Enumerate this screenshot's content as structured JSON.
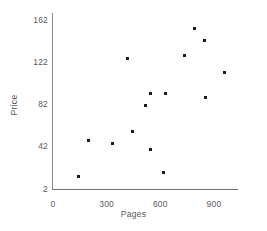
{
  "chart_data": {
    "type": "scatter",
    "title": "",
    "xlabel": "Pages",
    "ylabel": "Price",
    "xlim": [
      0,
      1000
    ],
    "ylim": [
      2,
      172
    ],
    "xticks": [
      0,
      300,
      600,
      900
    ],
    "xtick_labels": [
      "0",
      "300",
      "600",
      "900"
    ],
    "yticks": [
      2,
      42,
      82,
      122,
      162
    ],
    "ytick_labels": [
      "2",
      "42",
      "82",
      "122",
      "162"
    ],
    "grid": false,
    "legend": false,
    "marker": "square",
    "marker_color": "#1c1c1c",
    "axis_color": "#6f6f6f",
    "background": "#ffffff",
    "n_points": 15,
    "points": [
      {
        "pages": 145,
        "price": 14
      },
      {
        "pages": 200,
        "price": 48
      },
      {
        "pages": 330,
        "price": 45
      },
      {
        "pages": 418,
        "price": 126
      },
      {
        "pages": 445,
        "price": 56
      },
      {
        "pages": 518,
        "price": 81
      },
      {
        "pages": 546,
        "price": 92
      },
      {
        "pages": 546,
        "price": 39
      },
      {
        "pages": 618,
        "price": 18
      },
      {
        "pages": 630,
        "price": 92
      },
      {
        "pages": 735,
        "price": 128
      },
      {
        "pages": 790,
        "price": 154
      },
      {
        "pages": 847,
        "price": 143
      },
      {
        "pages": 852,
        "price": 89
      },
      {
        "pages": 958,
        "price": 112
      }
    ],
    "x": [
      145,
      200,
      330,
      418,
      445,
      518,
      546,
      546,
      618,
      630,
      735,
      790,
      847,
      852,
      958
    ],
    "y": [
      14,
      48,
      45,
      126,
      56,
      81,
      92,
      39,
      18,
      92,
      128,
      154,
      143,
      89,
      112
    ]
  }
}
